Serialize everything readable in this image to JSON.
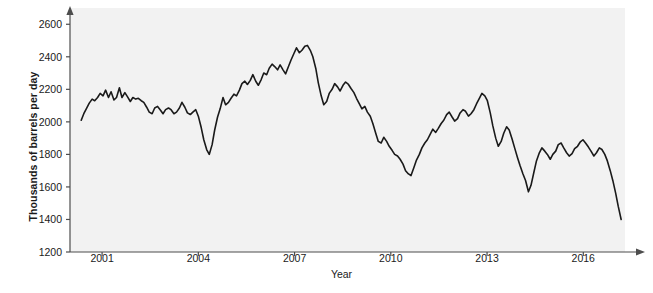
{
  "chart_data": {
    "type": "line",
    "title": "",
    "xlabel": "Year",
    "ylabel": "Thousands of barrels per day",
    "xlim": [
      2000.0,
      2017.3
    ],
    "ylim": [
      1200,
      2700
    ],
    "xticks": [
      2001,
      2004,
      2007,
      2010,
      2013,
      2016
    ],
    "xtick_labels": [
      "2001",
      "2004",
      "2007",
      "2010",
      "2013",
      "2016"
    ],
    "yticks": [
      1200,
      1400,
      1600,
      1800,
      2000,
      2200,
      2400,
      2600
    ],
    "ytick_labels": [
      "1200",
      "1400",
      "1600",
      "1800",
      "2000",
      "2200",
      "2400",
      "2600"
    ],
    "grid": false,
    "legend": null,
    "series": [
      {
        "name": "Thousands of barrels per day",
        "color": "#1a1a1a",
        "line_width": 1.6,
        "x": [
          2000.35,
          2000.43,
          2000.52,
          2000.6,
          2000.69,
          2000.77,
          2000.86,
          2000.94,
          2001.03,
          2001.11,
          2001.2,
          2001.28,
          2001.37,
          2001.45,
          2001.54,
          2001.62,
          2001.71,
          2001.79,
          2001.88,
          2001.96,
          2002.05,
          2002.13,
          2002.22,
          2002.3,
          2002.39,
          2002.47,
          2002.56,
          2002.64,
          2002.73,
          2002.81,
          2002.9,
          2002.98,
          2003.07,
          2003.15,
          2003.24,
          2003.32,
          2003.41,
          2003.49,
          2003.58,
          2003.66,
          2003.75,
          2003.83,
          2003.92,
          2004.0,
          2004.09,
          2004.17,
          2004.26,
          2004.34,
          2004.43,
          2004.51,
          2004.6,
          2004.68,
          2004.77,
          2004.85,
          2004.94,
          2005.02,
          2005.11,
          2005.19,
          2005.28,
          2005.36,
          2005.45,
          2005.53,
          2005.62,
          2005.7,
          2005.79,
          2005.87,
          2005.96,
          2006.04,
          2006.13,
          2006.21,
          2006.3,
          2006.38,
          2006.47,
          2006.55,
          2006.64,
          2006.72,
          2006.81,
          2006.89,
          2006.98,
          2007.06,
          2007.15,
          2007.23,
          2007.32,
          2007.4,
          2007.49,
          2007.57,
          2007.66,
          2007.74,
          2007.83,
          2007.91,
          2008.0,
          2008.08,
          2008.17,
          2008.25,
          2008.34,
          2008.42,
          2008.51,
          2008.59,
          2008.68,
          2008.76,
          2008.85,
          2008.93,
          2009.02,
          2009.1,
          2009.19,
          2009.27,
          2009.36,
          2009.44,
          2009.53,
          2009.61,
          2009.7,
          2009.78,
          2009.87,
          2009.95,
          2010.04,
          2010.12,
          2010.21,
          2010.29,
          2010.38,
          2010.46,
          2010.55,
          2010.63,
          2010.72,
          2010.8,
          2010.89,
          2010.97,
          2011.06,
          2011.14,
          2011.23,
          2011.31,
          2011.4,
          2011.48,
          2011.57,
          2011.65,
          2011.74,
          2011.82,
          2011.91,
          2011.99,
          2012.08,
          2012.16,
          2012.25,
          2012.33,
          2012.42,
          2012.5,
          2012.59,
          2012.67,
          2012.76,
          2012.84,
          2012.93,
          2013.01,
          2013.1,
          2013.18,
          2013.27,
          2013.35,
          2013.44,
          2013.52,
          2013.61,
          2013.69,
          2013.78,
          2013.86,
          2013.95,
          2014.03,
          2014.12,
          2014.2,
          2014.29,
          2014.37,
          2014.46,
          2014.54,
          2014.63,
          2014.71,
          2014.8,
          2014.88,
          2014.97,
          2015.05,
          2015.14,
          2015.22,
          2015.31,
          2015.39,
          2015.48,
          2015.56,
          2015.65,
          2015.73,
          2015.82,
          2015.9,
          2015.99,
          2016.07,
          2016.16,
          2016.24,
          2016.33,
          2016.41,
          2016.5,
          2016.58,
          2016.67,
          2016.75,
          2016.84,
          2016.92,
          2017.01,
          2017.09,
          2017.18
        ],
        "y": [
          2010,
          2050,
          2085,
          2115,
          2140,
          2130,
          2150,
          2175,
          2160,
          2195,
          2150,
          2185,
          2135,
          2150,
          2210,
          2150,
          2180,
          2155,
          2125,
          2150,
          2140,
          2145,
          2130,
          2120,
          2090,
          2060,
          2050,
          2085,
          2095,
          2075,
          2050,
          2075,
          2085,
          2075,
          2050,
          2060,
          2085,
          2120,
          2090,
          2055,
          2045,
          2060,
          2075,
          2035,
          1965,
          1890,
          1830,
          1800,
          1860,
          1950,
          2030,
          2080,
          2150,
          2105,
          2120,
          2145,
          2170,
          2160,
          2195,
          2235,
          2250,
          2230,
          2255,
          2290,
          2250,
          2225,
          2260,
          2300,
          2290,
          2330,
          2355,
          2340,
          2320,
          2350,
          2320,
          2295,
          2340,
          2380,
          2420,
          2455,
          2425,
          2440,
          2465,
          2470,
          2440,
          2400,
          2330,
          2240,
          2160,
          2105,
          2125,
          2175,
          2200,
          2235,
          2215,
          2190,
          2225,
          2245,
          2230,
          2205,
          2180,
          2145,
          2110,
          2080,
          2095,
          2060,
          2035,
          1990,
          1930,
          1880,
          1870,
          1905,
          1880,
          1850,
          1825,
          1800,
          1790,
          1770,
          1740,
          1700,
          1680,
          1670,
          1720,
          1765,
          1800,
          1840,
          1870,
          1890,
          1925,
          1955,
          1935,
          1960,
          1990,
          2010,
          2045,
          2060,
          2030,
          2005,
          2020,
          2055,
          2075,
          2065,
          2035,
          2050,
          2075,
          2110,
          2145,
          2175,
          2160,
          2130,
          2055,
          1975,
          1900,
          1850,
          1880,
          1930,
          1970,
          1950,
          1895,
          1840,
          1780,
          1730,
          1680,
          1640,
          1570,
          1610,
          1690,
          1760,
          1810,
          1840,
          1820,
          1800,
          1770,
          1800,
          1820,
          1860,
          1870,
          1840,
          1810,
          1790,
          1805,
          1835,
          1850,
          1875,
          1890,
          1870,
          1845,
          1820,
          1790,
          1810,
          1840,
          1830,
          1800,
          1760,
          1700,
          1640,
          1560,
          1480,
          1400
        ]
      }
    ]
  },
  "axes": {
    "x_title": "Year",
    "y_title": "Thousands of barrels per day",
    "x_arrow": true,
    "y_arrow": true
  },
  "style": {
    "plot_background": "#f2f2f2",
    "page_background": "#ffffff",
    "axis_color": "#4d4d4d",
    "line_color": "#1a1a1a",
    "text_color": "#1a1a1a"
  }
}
